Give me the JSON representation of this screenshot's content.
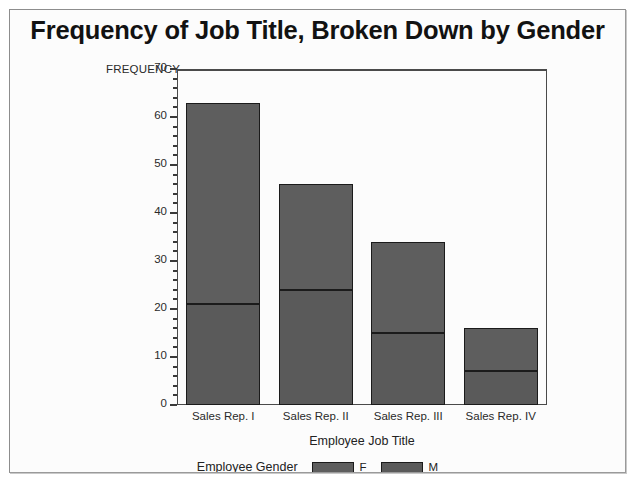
{
  "chart_data": {
    "type": "bar",
    "subtype": "stacked",
    "title": "Frequency of Job Title, Broken Down by Gender",
    "xlabel": "Employee Job Title",
    "ylabel": "FREQUENCY",
    "ylim": [
      0,
      70
    ],
    "y_major_step": 10,
    "y_minor_step": 2,
    "grid": false,
    "legend_position": "bottom",
    "legend_title": "Employee Gender",
    "categories": [
      "Sales Rep. I",
      "Sales Rep. II",
      "Sales Rep. III",
      "Sales Rep. IV"
    ],
    "series": [
      {
        "name": "M",
        "color": "#5a5a5a",
        "values": [
          21,
          24,
          15,
          7
        ]
      },
      {
        "name": "F",
        "color": "#5e5e5e",
        "values": [
          42,
          22,
          19,
          9
        ]
      }
    ],
    "totals": [
      63,
      46,
      34,
      16
    ],
    "y_major_ticks": [
      0,
      10,
      20,
      30,
      40,
      50,
      60,
      70
    ],
    "y_tick_labels": [
      "0",
      "10",
      "20",
      "30",
      "40",
      "50",
      "60",
      "70"
    ]
  },
  "legend": {
    "title": "Employee Gender",
    "entries": [
      {
        "label": "F",
        "color": "#5e5e5e"
      },
      {
        "label": "M",
        "color": "#5a5a5a"
      }
    ]
  }
}
